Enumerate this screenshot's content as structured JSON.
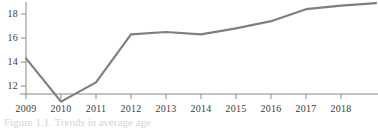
{
  "chart_data": {
    "type": "line",
    "title": "",
    "subtitle": "",
    "xlabel": "",
    "ylabel": "",
    "categories": [
      "2009",
      "2010",
      "2011",
      "2012",
      "2013",
      "2014",
      "2015",
      "2016",
      "2017",
      "2018",
      "2019"
    ],
    "x": [
      2009,
      2010,
      2011,
      2012,
      2013,
      2014,
      2015,
      2016,
      2017,
      2018,
      2019
    ],
    "values": [
      14.3,
      10.7,
      12.3,
      16.3,
      16.5,
      16.3,
      16.8,
      17.4,
      18.4,
      18.7,
      18.9
    ],
    "series": [
      {
        "name": "series-1",
        "values": [
          14.3,
          10.7,
          12.3,
          16.3,
          16.5,
          16.3,
          16.8,
          17.4,
          18.4,
          18.7,
          18.9
        ],
        "color": "#7f7f7f"
      }
    ],
    "ytick_labels": [
      "18",
      "16",
      "14",
      "12"
    ],
    "ytick_values": [
      18,
      16,
      14,
      12
    ],
    "xtick_labels": [
      "2009",
      "2010",
      "2011",
      "2012",
      "2013",
      "2014",
      "2015",
      "2016",
      "2017",
      "2018"
    ],
    "xlim": [
      2009,
      2019
    ],
    "ylim": [
      10.2,
      19.2
    ],
    "grid": false,
    "legend": false,
    "legend_position": "none",
    "line_color": "#7f7f7f",
    "axis_color": "#878787"
  },
  "figure": {
    "caption_clipped": "Figure 1.1. Trends in average age"
  }
}
